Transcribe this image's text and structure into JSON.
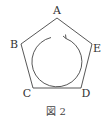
{
  "figure": {
    "caption": "図 2",
    "shape": "regular pentagon",
    "vertices": [
      {
        "label": "A",
        "x": 57,
        "y": 18,
        "lx": 57,
        "ly": 14
      },
      {
        "label": "E",
        "x": 92,
        "y": 44,
        "lx": 98,
        "ly": 52
      },
      {
        "label": "D",
        "x": 81,
        "y": 88,
        "lx": 87,
        "ly": 96
      },
      {
        "label": "C",
        "x": 33,
        "y": 88,
        "lx": 26,
        "ly": 96
      },
      {
        "label": "B",
        "x": 21,
        "y": 44,
        "lx": 13,
        "ly": 48
      }
    ],
    "circle_arrow": {
      "direction": "counterclockwise",
      "center": [
        57,
        62
      ],
      "radius": 25
    },
    "colors": {
      "line": "#444444",
      "text": "#333333"
    }
  }
}
